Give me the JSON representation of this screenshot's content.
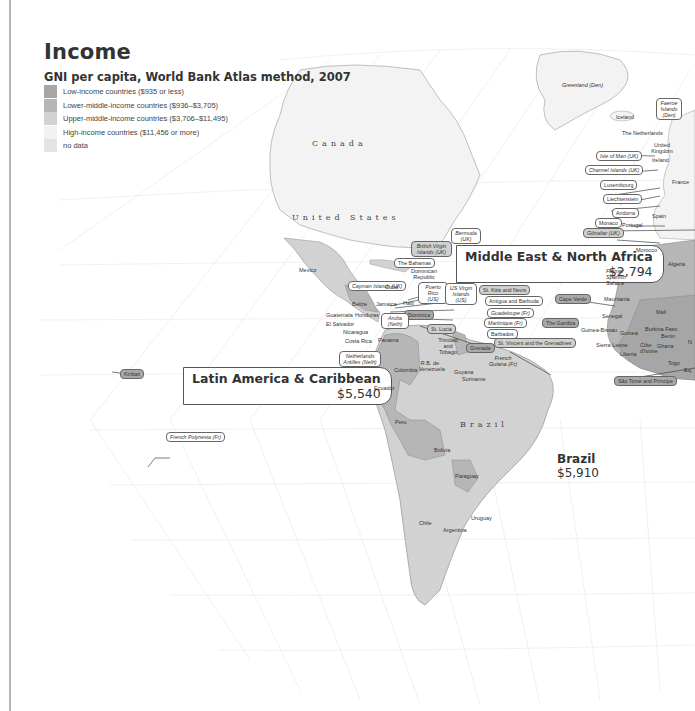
{
  "title": "Income",
  "subtitle": "GNI per capita, World Bank Atlas method, 2007",
  "legend": [
    {
      "label": "Low-income countries ($935 or less)",
      "color": "#a6a6a6"
    },
    {
      "label": "Lower-middle-income countries ($936–$3,705)",
      "color": "#b6b6b6"
    },
    {
      "label": "Upper-middle-income countries ($3,706–$11,495)",
      "color": "#d2d2d2"
    },
    {
      "label": "High-income countries ($11,456 or more)",
      "color": "#f2f2f2"
    },
    {
      "label": "no data",
      "color": "#e4e4e4"
    }
  ],
  "regions": {
    "latin_america": {
      "name": "Latin America & Caribbean",
      "value": "$5,540"
    },
    "mena": {
      "name": "Middle East & North Africa",
      "value": "$2,794"
    }
  },
  "callouts": {
    "brazil": {
      "name": "Brazil",
      "value": "$5,910"
    }
  },
  "big_labels": {
    "canada": "Canada",
    "united_states": "United States",
    "brazil": "Brazil"
  },
  "labels": {
    "greenland": "Greenland (Den)",
    "iceland": "Iceland",
    "faeroe": "Faeroe Islands (Den)",
    "netherlands": "The Netherlands",
    "uk": "United Kingdom",
    "ireland": "Ireland",
    "isle_of_man": "Isle of Man (UK)",
    "channel_islands": "Channel Islands (UK)",
    "luxembourg": "Luxembourg",
    "france": "France",
    "liechtenstein": "Liechtenstein",
    "andorra": "Andorra",
    "spain": "Spain",
    "monaco": "Monaco",
    "portugal": "Portugal",
    "gibraltar": "Gibraltar (UK)",
    "morocco": "Morocco",
    "algeria": "Algeria",
    "former_spanish_sahara": "Former Spanish Sahara",
    "mauritania": "Mauritania",
    "mali": "Mali",
    "senegal": "Senegal",
    "cape_verde": "Cape Verde",
    "the_gambia": "The Gambia",
    "guinea_bissau": "Guinea-Bissau",
    "guinea": "Guinea",
    "sierra_leone": "Sierra Leone",
    "liberia": "Liberia",
    "cote_divoire": "Côte d'Ivoire",
    "ghana": "Ghana",
    "burkina_faso": "Burkina Faso",
    "benin": "Benin",
    "togo": "Togo",
    "niger_partial": "N",
    "eq_partial": "Eq.",
    "sao_tome": "São Tomé and Príncipe",
    "bermuda": "Bermuda (UK)",
    "bvi": "British Virgin Islands (UK)",
    "bahamas": "The Bahamas",
    "dominican_republic": "Dominican Republic",
    "cayman": "Cayman Islands (UK)",
    "cuba": "Cuba",
    "puerto_rico": "Puerto Rico (US)",
    "usvi": "US Virgin Islands (US)",
    "st_kitts": "St. Kitts and Nevis",
    "antigua": "Antigua and Barbuda",
    "guadeloupe": "Guadeloupe (Fr)",
    "martinique": "Martinique (Fr)",
    "barbados": "Barbados",
    "st_vincent": "St. Vincent and the Grenadines",
    "dominica": "Dominica",
    "st_lucia": "St. Lucia",
    "grenada": "Grenada",
    "haiti": "Haiti",
    "jamaica": "Jamaica",
    "mexico": "Mexico",
    "belize": "Belize",
    "guatemala": "Guatemala",
    "honduras": "Honduras",
    "el_salvador": "El Salvador",
    "nicaragua": "Nicaragua",
    "costa_rica": "Costa Rica",
    "panama": "Panama",
    "aruba": "Aruba (Neth)",
    "neth_antilles": "Netherlands Antilles (Neth)",
    "trinidad": "Trinidad and Tobago",
    "venezuela": "R.B. de Venezuela",
    "guyana": "Guyana",
    "suriname": "Suriname",
    "french_guiana": "French Guiana (Fr)",
    "colombia": "Colombia",
    "ecuador": "Ecuador",
    "peru": "Peru",
    "bolivia": "Bolivia",
    "paraguay": "Paraguay",
    "chile": "Chile",
    "argentina": "Argentina",
    "uruguay": "Uruguay",
    "kiribati": "Kiribati",
    "french_polynesia": "French Polynesia (Fr)"
  }
}
